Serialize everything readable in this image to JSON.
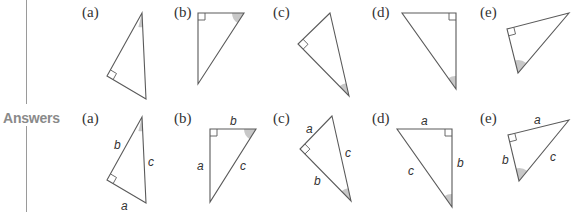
{
  "section_label": "Answers",
  "colors": {
    "line": "#5a5a5a",
    "angle_shade": "#c8c8c8",
    "label": "#8a8a8a"
  },
  "questions": [
    {
      "label": "(a)",
      "label_pos": [
        82,
        4
      ]
    },
    {
      "label": "(b)",
      "label_pos": [
        174,
        4
      ]
    },
    {
      "label": "(c)",
      "label_pos": [
        273,
        4
      ]
    },
    {
      "label": "(d)",
      "label_pos": [
        372,
        4
      ]
    },
    {
      "label": "(e)",
      "label_pos": [
        480,
        4
      ]
    }
  ],
  "answers": [
    {
      "label": "(a)",
      "label_pos": [
        82,
        110
      ],
      "sides": {
        "a": "a",
        "b": "b",
        "c": "c"
      }
    },
    {
      "label": "(b)",
      "label_pos": [
        174,
        110
      ],
      "sides": {
        "a": "a",
        "b": "b",
        "c": "c"
      }
    },
    {
      "label": "(c)",
      "label_pos": [
        273,
        110
      ],
      "sides": {
        "a": "a",
        "b": "b",
        "c": "c"
      }
    },
    {
      "label": "(d)",
      "label_pos": [
        372,
        110
      ],
      "sides": {
        "a": "a",
        "b": "b",
        "c": "c"
      }
    },
    {
      "label": "(e)",
      "label_pos": [
        480,
        110
      ],
      "sides": {
        "a": "a",
        "b": "b",
        "c": "c"
      }
    }
  ]
}
